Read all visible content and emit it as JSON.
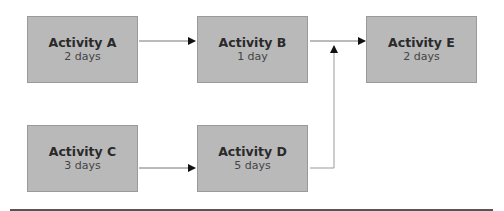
{
  "diagram": {
    "type": "activity-network",
    "nodes": [
      {
        "id": "A",
        "label": "Activity A",
        "duration": "2 days"
      },
      {
        "id": "B",
        "label": "Activity B",
        "duration": "1 day"
      },
      {
        "id": "C",
        "label": "Activity C",
        "duration": "3 days"
      },
      {
        "id": "D",
        "label": "Activity D",
        "duration": "5 days"
      },
      {
        "id": "E",
        "label": "Activity E",
        "duration": "2 days"
      }
    ],
    "edges": [
      {
        "from": "A",
        "to": "B"
      },
      {
        "from": "B",
        "to": "E"
      },
      {
        "from": "C",
        "to": "D"
      },
      {
        "from": "D",
        "to": "E"
      }
    ],
    "colors": {
      "box_fill": "#b9b9b9",
      "line": "#666666",
      "arrowhead": "#111111"
    }
  }
}
